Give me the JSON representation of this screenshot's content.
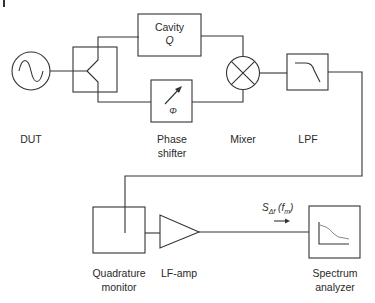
{
  "diagram": {
    "type": "block-diagram",
    "blocks": {
      "dut": {
        "label": "DUT",
        "icon": "sine-wave-source-icon"
      },
      "splitter": {
        "label": "",
        "icon": "power-splitter-icon"
      },
      "cavity": {
        "label": "Cavity",
        "sub": "Q"
      },
      "phase_shifter": {
        "label_line1": "Phase",
        "label_line2": "shifter",
        "symbol": "Φ"
      },
      "mixer": {
        "label": "Mixer",
        "icon": "mixer-x-circle-icon"
      },
      "lpf": {
        "label": "LPF",
        "icon": "lowpass-curve-icon"
      },
      "quadrature_monitor": {
        "label_line1": "Quadrature",
        "label_line2": "monitor"
      },
      "lf_amp": {
        "label": "LF-amp",
        "icon": "amplifier-triangle-icon"
      },
      "spectrum_analyzer": {
        "label_line1": "Spectrum",
        "label_line2": "analyzer",
        "icon": "spectrum-plot-icon"
      }
    },
    "signal": {
      "symbol": "S",
      "subscript": "Δf",
      "argument": "(f",
      "arg_sub": "m",
      "close": ")"
    },
    "connections": [
      [
        "dut",
        "splitter"
      ],
      [
        "splitter",
        "cavity"
      ],
      [
        "splitter",
        "phase_shifter"
      ],
      [
        "cavity",
        "mixer"
      ],
      [
        "phase_shifter",
        "mixer"
      ],
      [
        "mixer",
        "lpf"
      ],
      [
        "lpf",
        "lf_amp"
      ],
      [
        "lpf",
        "quadrature_monitor"
      ],
      [
        "lf_amp",
        "spectrum_analyzer"
      ]
    ],
    "colors": {
      "line": "#333333",
      "text": "#2a2a2a",
      "curve": "#777777",
      "background": "#ffffff"
    }
  }
}
